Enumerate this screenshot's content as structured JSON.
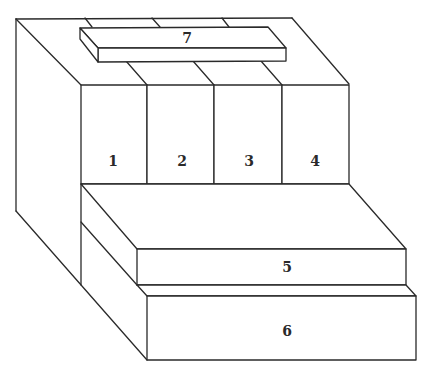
{
  "diagram": {
    "type": "isometric-block-assembly",
    "stroke_color": "#2a2a2a",
    "background": "#ffffff",
    "parts": [
      {
        "id": "1",
        "label": "1",
        "role": "upper-front-box"
      },
      {
        "id": "2",
        "label": "2",
        "role": "upper-front-box"
      },
      {
        "id": "3",
        "label": "3",
        "role": "upper-front-box"
      },
      {
        "id": "4",
        "label": "4",
        "role": "upper-front-box"
      },
      {
        "id": "5",
        "label": "5",
        "role": "middle-step"
      },
      {
        "id": "6",
        "label": "6",
        "role": "bottom-step"
      },
      {
        "id": "7",
        "label": "7",
        "role": "top-bar"
      }
    ]
  },
  "labels": {
    "box1": "1",
    "box2": "2",
    "box3": "3",
    "box4": "4",
    "step5": "5",
    "step6": "6",
    "bar7": "7"
  }
}
